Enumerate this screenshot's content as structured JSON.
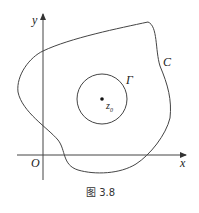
{
  "figure": {
    "caption": "图 3.8",
    "labels": {
      "y_axis": "y",
      "x_axis": "x",
      "origin": "O",
      "outer_curve": "C",
      "inner_circle": "Γ",
      "center_point": "z",
      "center_subscript": "0"
    },
    "colors": {
      "stroke": "#444444",
      "text": "#222222"
    }
  }
}
